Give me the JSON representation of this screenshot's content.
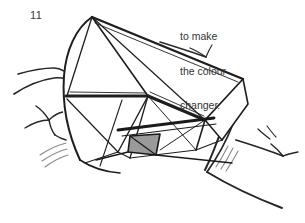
{
  "figure": {
    "step_number": "11",
    "caption_lines": [
      "to make",
      "the colour",
      "changer."
    ],
    "caption_text": "to make the colour changer.",
    "colors": {
      "ink": "#1a1a1a",
      "line_light": "#2b2b2b",
      "shaded_face": "#9a9a9a",
      "shaded_face_edge": "#1a1a1a",
      "background": "#ffffff",
      "text": "#333333",
      "sketch_light": "#7d7d7d"
    },
    "diagram": {
      "type": "origami-instruction-line-drawing",
      "subject": "folded paper colour changer held in two hands",
      "shaded_face_label": "grey-shaded triangular face",
      "parts": [
        "left fan of triangular facets",
        "central peak",
        "right folded wing",
        "left hand fingers",
        "right hand fingers"
      ]
    }
  }
}
